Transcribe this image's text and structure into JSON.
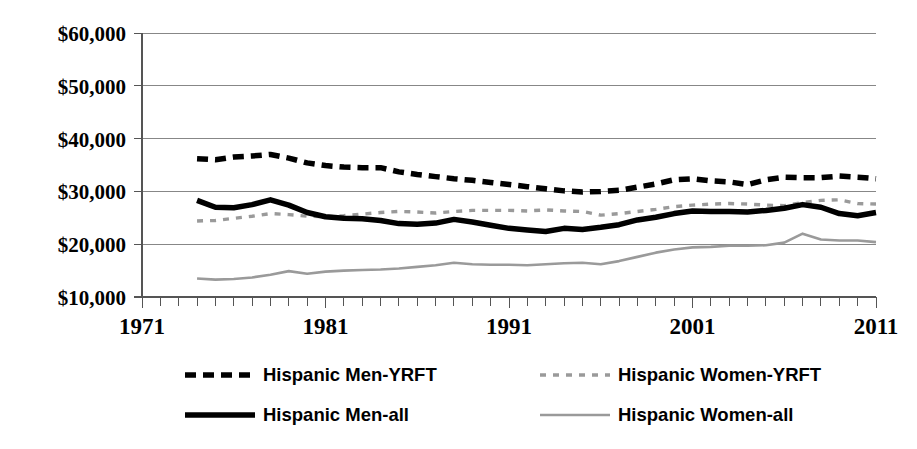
{
  "chart_data": {
    "type": "line",
    "title": "",
    "subtitle": "",
    "xlabel": "",
    "ylabel": "",
    "xlim": [
      1971,
      2011
    ],
    "ylim": [
      10000,
      60000
    ],
    "grid": true,
    "legend_position": "bottom",
    "y_tick_labels": [
      "$60,000",
      "$50,000",
      "$40,000",
      "$30,000",
      "$20,000",
      "$10,000"
    ],
    "y_tick_values": [
      60000,
      50000,
      40000,
      30000,
      20000,
      10000
    ],
    "x_tick_labels": [
      "1971",
      "1981",
      "1991",
      "2001",
      "2011"
    ],
    "x_tick_values": [
      1971,
      1981,
      1991,
      2001,
      2011
    ],
    "x_minor_tick_step": 1,
    "x": [
      1974,
      1975,
      1976,
      1977,
      1978,
      1979,
      1980,
      1981,
      1982,
      1983,
      1984,
      1985,
      1986,
      1987,
      1988,
      1989,
      1990,
      1991,
      1992,
      1993,
      1994,
      1995,
      1996,
      1997,
      1998,
      1999,
      2000,
      2001,
      2002,
      2003,
      2004,
      2005,
      2006,
      2007,
      2008,
      2009,
      2010,
      2011
    ],
    "series": [
      {
        "name": "Hispanic Men-YRFT",
        "style": "dashed",
        "color": "#000000",
        "width": 5.5,
        "dash": "11,7",
        "values": [
          36200,
          36000,
          36500,
          36700,
          37000,
          36300,
          35400,
          34900,
          34600,
          34500,
          34500,
          33700,
          33200,
          32800,
          32400,
          32100,
          31700,
          31300,
          30900,
          30500,
          30100,
          29900,
          30000,
          30200,
          30800,
          31400,
          32200,
          32400,
          32000,
          31800,
          31300,
          32200,
          32700,
          32600,
          32600,
          32900,
          32700,
          32400
        ]
      },
      {
        "name": "Hispanic Women-YRFT",
        "style": "dashed",
        "color": "#9a9a9a",
        "width": 3.4,
        "dash": "6,7",
        "values": [
          24400,
          24500,
          24900,
          25300,
          25800,
          25600,
          25300,
          25200,
          25400,
          25700,
          26000,
          26200,
          26100,
          25900,
          26200,
          26400,
          26400,
          26400,
          26300,
          26500,
          26300,
          26200,
          25500,
          25800,
          26200,
          26600,
          27100,
          27400,
          27600,
          27700,
          27600,
          27400,
          27300,
          27900,
          28300,
          28400,
          27700,
          27600
        ]
      },
      {
        "name": "Hispanic Men-all",
        "style": "solid",
        "color": "#000000",
        "width": 5.5,
        "dash": "",
        "values": [
          28300,
          27000,
          26900,
          27500,
          28400,
          27400,
          26000,
          25200,
          24900,
          24800,
          24500,
          23900,
          23800,
          24000,
          24700,
          24200,
          23600,
          23000,
          22700,
          22400,
          23000,
          22800,
          23200,
          23700,
          24600,
          25100,
          25800,
          26300,
          26200,
          26200,
          26100,
          26400,
          26800,
          27500,
          27000,
          25800,
          25400,
          26000
        ]
      },
      {
        "name": "Hispanic Women-all",
        "style": "solid",
        "color": "#9a9a9a",
        "width": 2.6,
        "dash": "",
        "values": [
          13500,
          13300,
          13400,
          13700,
          14200,
          14900,
          14400,
          14800,
          15000,
          15100,
          15200,
          15400,
          15700,
          16000,
          16500,
          16200,
          16100,
          16100,
          16000,
          16200,
          16400,
          16500,
          16200,
          16800,
          17600,
          18400,
          19000,
          19400,
          19500,
          19700,
          19700,
          19800,
          20300,
          22000,
          20900,
          20700,
          20700,
          20400
        ]
      }
    ]
  },
  "legend": {
    "entries": [
      {
        "label": "Hispanic Men-YRFT",
        "marker": "dashed-black-thick"
      },
      {
        "label": "Hispanic Women-YRFT",
        "marker": "dashed-gray-thin"
      },
      {
        "label": "Hispanic Men-all",
        "marker": "solid-black-thick"
      },
      {
        "label": "Hispanic Women-all",
        "marker": "solid-gray-thin"
      }
    ]
  },
  "colors": {
    "series_black": "#000000",
    "series_gray": "#9a9a9a",
    "gridline": "#878787",
    "axis": "#555555",
    "background": "#ffffff"
  }
}
